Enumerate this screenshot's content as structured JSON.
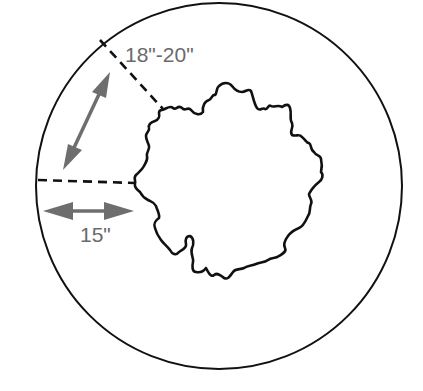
{
  "diagram": {
    "colors": {
      "outline": "#111111",
      "arrow": "#6e6e6e",
      "label": "#6a6a6a",
      "background": "#ffffff"
    },
    "outer_circle": {
      "description": "planting area boundary",
      "cx": 219,
      "cy": 186,
      "r": 183
    },
    "root_ball": {
      "description": "irregular root ball outline at center"
    },
    "measurements": [
      {
        "id": "diagonal",
        "label": "18\"-20\"",
        "description": "distance from root ball to edge along diagonal"
      },
      {
        "id": "horizontal",
        "label": "15\"",
        "description": "distance from root ball to edge horizontally"
      }
    ]
  }
}
